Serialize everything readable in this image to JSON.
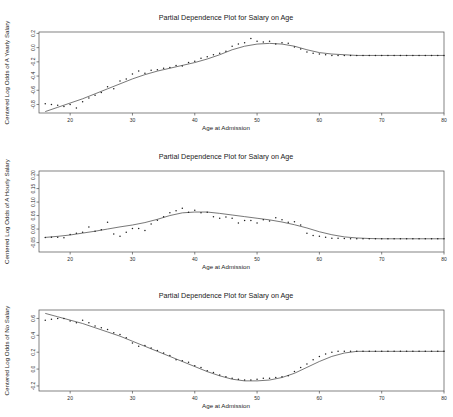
{
  "figure": {
    "width": 453,
    "height": 417,
    "background": "#ffffff",
    "point_color": "#1f1f1f",
    "line_color": "#555555",
    "frame_color": "#4d4d4d",
    "panel_count": 3
  },
  "chart_data": [
    {
      "type": "scatter",
      "title": "Partial Dependence Plot for Salary on Age",
      "xlabel": "Age at Admission",
      "ylabel": "Centered Log Odds of A Yearly Salary",
      "xlim": [
        15,
        80
      ],
      "ylim": [
        -0.92,
        0.22
      ],
      "xticks": [
        20,
        30,
        40,
        50,
        60,
        70,
        80
      ],
      "xtick_labels": [
        "20",
        "30",
        "40",
        "50",
        "60",
        "70",
        "80"
      ],
      "yticks": [
        -0.8,
        -0.6,
        -0.4,
        -0.2,
        0.0,
        0.2
      ],
      "ytick_labels": [
        "-0.8",
        "-0.6",
        "-0.4",
        "-0.2",
        "0.0",
        "0.2"
      ],
      "grid": false,
      "legend": "none",
      "x": [
        16,
        17,
        18,
        19,
        20,
        21,
        22,
        23,
        24,
        25,
        26,
        27,
        28,
        29,
        30,
        31,
        32,
        33,
        34,
        35,
        36,
        37,
        38,
        39,
        40,
        41,
        42,
        43,
        44,
        45,
        46,
        47,
        48,
        49,
        50,
        51,
        52,
        53,
        54,
        55,
        56,
        57,
        58,
        59,
        60,
        61,
        62,
        63,
        64,
        65,
        66,
        67,
        68,
        69,
        70,
        71,
        72,
        73,
        74,
        75,
        76,
        77,
        78,
        79,
        80
      ],
      "y": [
        -0.79,
        -0.8,
        -0.81,
        -0.83,
        -0.8,
        -0.85,
        -0.76,
        -0.71,
        -0.67,
        -0.63,
        -0.55,
        -0.58,
        -0.47,
        -0.44,
        -0.37,
        -0.33,
        -0.36,
        -0.32,
        -0.31,
        -0.29,
        -0.28,
        -0.25,
        -0.26,
        -0.21,
        -0.19,
        -0.15,
        -0.13,
        -0.1,
        -0.08,
        -0.05,
        0.02,
        0.05,
        0.07,
        0.13,
        0.09,
        0.08,
        0.09,
        0.05,
        0.07,
        0.06,
        0.01,
        -0.02,
        -0.06,
        -0.08,
        -0.09,
        -0.1,
        -0.11,
        -0.11,
        -0.11,
        -0.11,
        -0.11,
        -0.11,
        -0.11,
        -0.11,
        -0.11,
        -0.11,
        -0.11,
        -0.11,
        -0.11,
        -0.11,
        -0.11,
        -0.11,
        -0.11,
        -0.11,
        -0.11
      ],
      "fit_x": [
        16,
        18,
        20,
        22,
        24,
        26,
        28,
        30,
        32,
        34,
        36,
        38,
        40,
        42,
        44,
        46,
        48,
        50,
        52,
        54,
        56,
        58,
        60,
        62,
        64,
        66,
        68,
        70,
        72,
        74,
        76,
        78,
        80
      ],
      "fit_y": [
        -0.9,
        -0.84,
        -0.78,
        -0.72,
        -0.65,
        -0.58,
        -0.51,
        -0.44,
        -0.38,
        -0.33,
        -0.29,
        -0.25,
        -0.21,
        -0.16,
        -0.1,
        -0.03,
        0.02,
        0.05,
        0.06,
        0.05,
        0.02,
        -0.03,
        -0.07,
        -0.09,
        -0.1,
        -0.11,
        -0.11,
        -0.11,
        -0.11,
        -0.11,
        -0.11,
        -0.11,
        -0.11
      ]
    },
    {
      "type": "scatter",
      "title": "Partial Dependence Plot for Salary on Age",
      "xlabel": "Age at Admission",
      "ylabel": "Centered Log Odds of A Hourly Salary",
      "xlim": [
        15,
        80
      ],
      "ylim": [
        -0.085,
        0.215
      ],
      "xticks": [
        20,
        30,
        40,
        50,
        60,
        70,
        80
      ],
      "xtick_labels": [
        "20",
        "30",
        "40",
        "50",
        "60",
        "70",
        "80"
      ],
      "yticks": [
        -0.05,
        0.0,
        0.05,
        0.1,
        0.15,
        0.2
      ],
      "ytick_labels": [
        "-0.05",
        "0.00",
        "0.05",
        "0.10",
        "0.15",
        "0.20"
      ],
      "grid": false,
      "legend": "none",
      "x": [
        16,
        17,
        18,
        19,
        20,
        21,
        22,
        23,
        24,
        25,
        26,
        27,
        28,
        29,
        30,
        31,
        32,
        33,
        34,
        35,
        36,
        37,
        38,
        39,
        40,
        41,
        42,
        43,
        44,
        45,
        46,
        47,
        48,
        49,
        50,
        51,
        52,
        53,
        54,
        55,
        56,
        57,
        58,
        59,
        60,
        61,
        62,
        63,
        64,
        65,
        66,
        67,
        68,
        69,
        70,
        71,
        72,
        73,
        74,
        75,
        76,
        77,
        78,
        79,
        80
      ],
      "y": [
        -0.031,
        -0.03,
        -0.03,
        -0.032,
        -0.02,
        -0.016,
        -0.012,
        0.008,
        -0.008,
        -0.003,
        0.025,
        -0.018,
        -0.027,
        -0.012,
        0.002,
        0.002,
        -0.005,
        0.019,
        0.033,
        0.046,
        0.06,
        0.068,
        0.077,
        0.062,
        0.07,
        0.06,
        0.062,
        0.046,
        0.04,
        0.045,
        0.04,
        0.022,
        0.032,
        0.032,
        0.022,
        0.034,
        0.03,
        0.042,
        0.034,
        0.025,
        0.027,
        0.015,
        -0.016,
        -0.024,
        -0.027,
        -0.03,
        -0.034,
        -0.034,
        -0.035,
        -0.036,
        -0.036,
        -0.036,
        -0.036,
        -0.036,
        -0.036,
        -0.036,
        -0.036,
        -0.036,
        -0.036,
        -0.036,
        -0.036,
        -0.036,
        -0.036,
        -0.036,
        -0.036
      ],
      "fit_x": [
        16,
        18,
        20,
        22,
        24,
        26,
        28,
        30,
        32,
        34,
        36,
        38,
        40,
        42,
        44,
        46,
        48,
        50,
        52,
        54,
        56,
        58,
        60,
        62,
        64,
        66,
        68,
        70,
        72,
        74,
        76,
        78,
        80
      ],
      "fit_y": [
        -0.031,
        -0.027,
        -0.022,
        -0.015,
        -0.008,
        0.0,
        0.008,
        0.015,
        0.024,
        0.036,
        0.05,
        0.06,
        0.063,
        0.063,
        0.058,
        0.052,
        0.046,
        0.04,
        0.034,
        0.026,
        0.016,
        0.004,
        -0.01,
        -0.021,
        -0.029,
        -0.033,
        -0.035,
        -0.036,
        -0.036,
        -0.036,
        -0.036,
        -0.036,
        -0.036
      ]
    },
    {
      "type": "scatter",
      "title": "Partial Dependence Plot for Salary on Age",
      "xlabel": "Age at Admission",
      "ylabel": "Centered Log Odds of No Salary",
      "xlim": [
        15,
        80
      ],
      "ylim": [
        -0.26,
        0.7
      ],
      "xticks": [
        20,
        30,
        40,
        50,
        60,
        70,
        80
      ],
      "xtick_labels": [
        "20",
        "30",
        "40",
        "50",
        "60",
        "70",
        "80"
      ],
      "yticks": [
        -0.2,
        0.0,
        0.2,
        0.4,
        0.6
      ],
      "ytick_labels": [
        "-0.2",
        "0.0",
        "0.2",
        "0.4",
        "0.6"
      ],
      "grid": false,
      "legend": "none",
      "x": [
        16,
        17,
        18,
        19,
        20,
        21,
        22,
        23,
        24,
        25,
        26,
        27,
        28,
        29,
        30,
        31,
        32,
        33,
        34,
        35,
        36,
        37,
        38,
        39,
        40,
        41,
        42,
        43,
        44,
        45,
        46,
        47,
        48,
        49,
        50,
        51,
        52,
        53,
        54,
        55,
        56,
        57,
        58,
        59,
        60,
        61,
        62,
        63,
        64,
        65,
        66,
        67,
        68,
        69,
        70,
        71,
        72,
        73,
        74,
        75,
        76,
        77,
        78,
        79,
        80
      ],
      "y": [
        0.58,
        0.59,
        0.6,
        0.6,
        0.57,
        0.55,
        0.58,
        0.55,
        0.51,
        0.49,
        0.47,
        0.43,
        0.41,
        0.37,
        0.31,
        0.27,
        0.28,
        0.25,
        0.22,
        0.19,
        0.16,
        0.11,
        0.1,
        0.08,
        0.04,
        0.02,
        -0.02,
        -0.04,
        -0.07,
        -0.09,
        -0.11,
        -0.12,
        -0.13,
        -0.13,
        -0.12,
        -0.11,
        -0.11,
        -0.1,
        -0.09,
        -0.08,
        -0.03,
        0.02,
        0.06,
        0.11,
        0.15,
        0.18,
        0.2,
        0.21,
        0.21,
        0.21,
        0.21,
        0.21,
        0.21,
        0.21,
        0.21,
        0.21,
        0.21,
        0.21,
        0.21,
        0.21,
        0.21,
        0.21,
        0.21,
        0.21,
        0.21
      ],
      "fit_x": [
        16,
        18,
        20,
        22,
        24,
        26,
        28,
        30,
        32,
        34,
        36,
        38,
        40,
        42,
        44,
        46,
        48,
        50,
        52,
        54,
        56,
        58,
        60,
        62,
        64,
        66,
        68,
        70,
        72,
        74,
        76,
        78,
        80
      ],
      "fit_y": [
        0.66,
        0.62,
        0.58,
        0.54,
        0.49,
        0.44,
        0.39,
        0.33,
        0.27,
        0.21,
        0.15,
        0.09,
        0.03,
        -0.03,
        -0.08,
        -0.12,
        -0.14,
        -0.14,
        -0.13,
        -0.1,
        -0.05,
        0.02,
        0.09,
        0.15,
        0.19,
        0.21,
        0.21,
        0.21,
        0.21,
        0.21,
        0.21,
        0.21,
        0.21
      ]
    }
  ]
}
